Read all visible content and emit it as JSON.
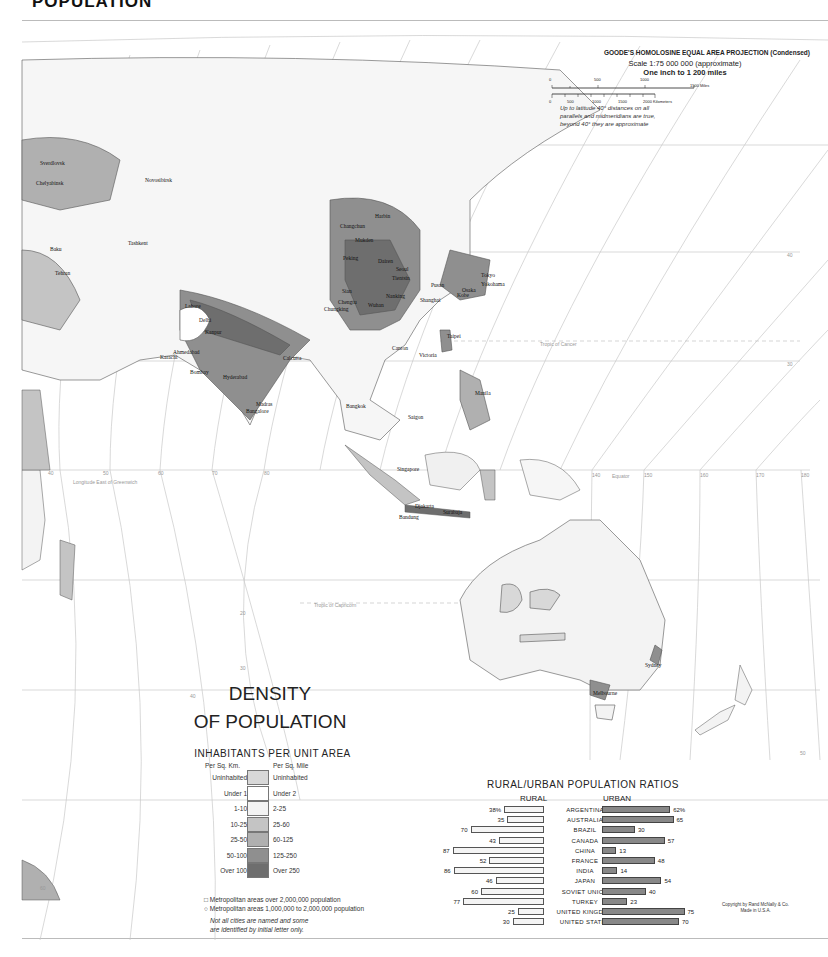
{
  "page": {
    "title": "POPULATION"
  },
  "projection": {
    "name": "GOODE'S HOMOLOSINE EQUAL AREA PROJECTION (Condensed)",
    "scale": "Scale 1:75 000 000 (approximate)",
    "inch": "One inch to 1 200 miles",
    "miles_ticks": [
      "0",
      "500",
      "1000",
      "1500 Miles"
    ],
    "km_ticks": [
      "0",
      "500",
      "1000",
      "1500",
      "2000 Kilometers"
    ],
    "note_lines": [
      "Up to latitude 40° distances on all",
      "parallels and midmeridians are true,",
      "beyond 40° they are approximate"
    ]
  },
  "map": {
    "cities": [
      {
        "name": "Sverdlovsk",
        "x": 40,
        "y": 160
      },
      {
        "name": "Chelyabinsk",
        "x": 36,
        "y": 180
      },
      {
        "name": "Novosibirsk",
        "x": 145,
        "y": 177
      },
      {
        "name": "Baku",
        "x": 50,
        "y": 246
      },
      {
        "name": "Tashkent",
        "x": 128,
        "y": 240
      },
      {
        "name": "Tehran",
        "x": 55,
        "y": 270
      },
      {
        "name": "Harbin",
        "x": 375,
        "y": 213
      },
      {
        "name": "Changchun",
        "x": 340,
        "y": 223
      },
      {
        "name": "Mukden",
        "x": 355,
        "y": 237
      },
      {
        "name": "Peking",
        "x": 343,
        "y": 255
      },
      {
        "name": "Dairen",
        "x": 378,
        "y": 258
      },
      {
        "name": "Seoul",
        "x": 396,
        "y": 266
      },
      {
        "name": "Tientsin",
        "x": 392,
        "y": 275
      },
      {
        "name": "Pusan",
        "x": 431,
        "y": 282
      },
      {
        "name": "Tokyo",
        "x": 481,
        "y": 272
      },
      {
        "name": "Yokohama",
        "x": 481,
        "y": 281
      },
      {
        "name": "Osaka",
        "x": 462,
        "y": 287
      },
      {
        "name": "Kobe",
        "x": 457,
        "y": 292
      },
      {
        "name": "Shanghai",
        "x": 420,
        "y": 297
      },
      {
        "name": "Nanking",
        "x": 386,
        "y": 293
      },
      {
        "name": "Sian",
        "x": 342,
        "y": 288
      },
      {
        "name": "Chengtu",
        "x": 338,
        "y": 299
      },
      {
        "name": "Chungking",
        "x": 324,
        "y": 306
      },
      {
        "name": "Wuhan",
        "x": 368,
        "y": 302
      },
      {
        "name": "Lahore",
        "x": 185,
        "y": 303
      },
      {
        "name": "Delhi",
        "x": 199,
        "y": 317
      },
      {
        "name": "Kanpur",
        "x": 205,
        "y": 329
      },
      {
        "name": "Karachi",
        "x": 160,
        "y": 354
      },
      {
        "name": "Ahmedabad",
        "x": 173,
        "y": 349
      },
      {
        "name": "Bombay",
        "x": 190,
        "y": 369
      },
      {
        "name": "Hyderabad",
        "x": 223,
        "y": 374
      },
      {
        "name": "Calcutta",
        "x": 283,
        "y": 355
      },
      {
        "name": "Madras",
        "x": 256,
        "y": 401
      },
      {
        "name": "Bangalore",
        "x": 246,
        "y": 408
      },
      {
        "name": "Canton",
        "x": 392,
        "y": 345
      },
      {
        "name": "Victoria",
        "x": 419,
        "y": 352
      },
      {
        "name": "Taipei",
        "x": 447,
        "y": 333
      },
      {
        "name": "Manila",
        "x": 475,
        "y": 390
      },
      {
        "name": "Bangkok",
        "x": 346,
        "y": 403
      },
      {
        "name": "Saigon",
        "x": 408,
        "y": 414
      },
      {
        "name": "Singapore",
        "x": 397,
        "y": 466
      },
      {
        "name": "Djakarta",
        "x": 415,
        "y": 503
      },
      {
        "name": "Surabaja",
        "x": 443,
        "y": 509
      },
      {
        "name": "Bandung",
        "x": 399,
        "y": 514
      },
      {
        "name": "Sydney",
        "x": 645,
        "y": 662
      },
      {
        "name": "Melbourne",
        "x": 593,
        "y": 690
      }
    ],
    "annotations": [
      {
        "text": "Tropic of Cancer",
        "x": 540,
        "y": 341
      },
      {
        "text": "Tropic of Capricorn",
        "x": 314,
        "y": 602
      },
      {
        "text": "Longitude East of Greenwich",
        "x": 73,
        "y": 479
      },
      {
        "text": "Equator",
        "x": 612,
        "y": 473
      }
    ],
    "meridian_labels": [
      {
        "text": "40",
        "x": 48,
        "y": 470
      },
      {
        "text": "50",
        "x": 103,
        "y": 470
      },
      {
        "text": "60",
        "x": 158,
        "y": 470
      },
      {
        "text": "70",
        "x": 212,
        "y": 470
      },
      {
        "text": "80",
        "x": 264,
        "y": 470
      },
      {
        "text": "140",
        "x": 592,
        "y": 472
      },
      {
        "text": "150",
        "x": 644,
        "y": 472
      },
      {
        "text": "160",
        "x": 700,
        "y": 472
      },
      {
        "text": "170",
        "x": 756,
        "y": 472
      },
      {
        "text": "180",
        "x": 801,
        "y": 472
      }
    ],
    "parallel_labels": [
      {
        "text": "40",
        "x": 787,
        "y": 252
      },
      {
        "text": "30",
        "x": 787,
        "y": 361
      },
      {
        "text": "20",
        "x": 240,
        "y": 610
      },
      {
        "text": "30",
        "x": 240,
        "y": 665
      },
      {
        "text": "40",
        "x": 190,
        "y": 693
      },
      {
        "text": "50",
        "x": 800,
        "y": 750
      },
      {
        "text": "60",
        "x": 40,
        "y": 885
      }
    ]
  },
  "legend": {
    "title_line1": "DENSITY",
    "title_line2": "OF POPULATION",
    "subtitle": "INHABITANTS PER UNIT AREA",
    "col_km": "Per Sq. Km.",
    "col_mile": "Per Sq. Mile",
    "rows": [
      {
        "km": "Uninhabited",
        "mile": "Uninhabited",
        "color": "#d8d8d8"
      },
      {
        "km": "Under 1",
        "mile": "Under 2",
        "color": "#ffffff"
      },
      {
        "km": "1-10",
        "mile": "2-25",
        "color": "#f3f3f3"
      },
      {
        "km": "10-25",
        "mile": "25-60",
        "color": "#c4c4c4"
      },
      {
        "km": "25-50",
        "mile": "60-125",
        "color": "#b0b0b0"
      },
      {
        "km": "50-100",
        "mile": "125-250",
        "color": "#8f8f8f"
      },
      {
        "km": "Over 100",
        "mile": "Over 250",
        "color": "#6e6e6e"
      }
    ],
    "metro_1": "□ Metropolitan areas over 2,000,000 population",
    "metro_2": "○ Metropolitan areas 1,000,000 to 2,000,000 population",
    "note_1": "Not all cities are named and some",
    "note_2": "are identified by initial letter only."
  },
  "ratios": {
    "title": "RURAL/URBAN POPULATION RATIOS",
    "rural_label": "RURAL",
    "urban_label": "URBAN"
  },
  "chart_data": {
    "type": "bar",
    "title": "RURAL/URBAN POPULATION RATIOS",
    "xlabel": "",
    "ylabel": "Percent",
    "categories": [
      "ARGENTINA",
      "AUSTRALIA",
      "BRAZIL",
      "CANADA",
      "CHINA",
      "FRANCE",
      "INDIA",
      "JAPAN",
      "SOVIET UNION",
      "TURKEY",
      "UNITED KINGDOM",
      "UNITED STATES"
    ],
    "series": [
      {
        "name": "RURAL",
        "values": [
          38,
          35,
          70,
          43,
          87,
          52,
          86,
          46,
          60,
          77,
          25,
          30
        ],
        "labels": [
          "38%",
          "35",
          "70",
          "43",
          "87",
          "52",
          "86",
          "46",
          "60",
          "77",
          "25",
          "30"
        ]
      },
      {
        "name": "URBAN",
        "values": [
          62,
          65,
          30,
          57,
          13,
          48,
          14,
          54,
          40,
          23,
          75,
          70
        ],
        "labels": [
          "62%",
          "65",
          "30",
          "57",
          "13",
          "48",
          "14",
          "54",
          "40",
          "23",
          "75",
          "70"
        ]
      }
    ],
    "ylim": [
      0,
      100
    ],
    "legend_position": "column headers"
  },
  "footer": {
    "copyright": "Copyright by Rand McNally & Co.",
    "made_in": "Made in U.S.A."
  }
}
